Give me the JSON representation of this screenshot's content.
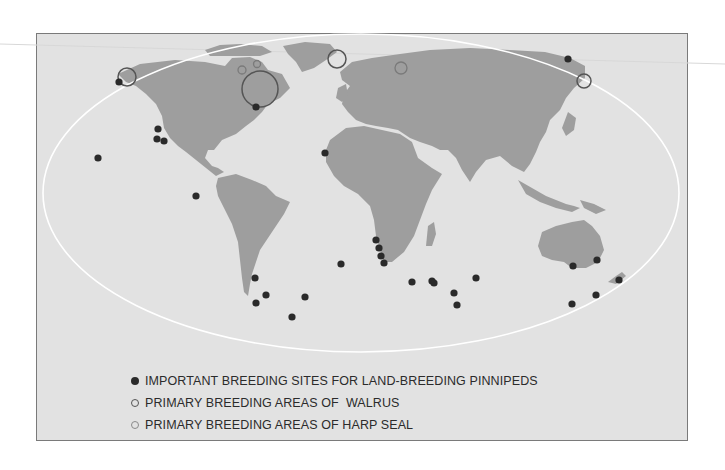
{
  "map": {
    "type": "world-map",
    "projection": "oval (Robinson-like)",
    "colors": {
      "background": "#e2e2e2",
      "land": "#9e9e9e",
      "oval_outline": "#ffffff",
      "breeding_site_marker": "#2a2a2a",
      "walrus_marker": "#555555",
      "harp_seal_marker": "#8a8a8a"
    }
  },
  "legend": {
    "items": [
      {
        "symbol": "filled-dot",
        "label": "IMPORTANT BREEDING SITES FOR LAND-BREEDING PINNIPEDS"
      },
      {
        "symbol": "open-circle-dark",
        "label": "PRIMARY BREEDING AREAS OF  WALRUS"
      },
      {
        "symbol": "open-circle-light",
        "label": "PRIMARY BREEDING AREAS OF HARP SEAL"
      }
    ]
  },
  "markers": {
    "breeding_sites": [
      {
        "x": 119,
        "y": 82
      },
      {
        "x": 98,
        "y": 158
      },
      {
        "x": 158,
        "y": 129
      },
      {
        "x": 157,
        "y": 139
      },
      {
        "x": 164,
        "y": 141
      },
      {
        "x": 196,
        "y": 196
      },
      {
        "x": 256,
        "y": 107
      },
      {
        "x": 325,
        "y": 153
      },
      {
        "x": 568,
        "y": 59
      },
      {
        "x": 255,
        "y": 278
      },
      {
        "x": 266,
        "y": 295
      },
      {
        "x": 256,
        "y": 303
      },
      {
        "x": 305,
        "y": 297
      },
      {
        "x": 292,
        "y": 317
      },
      {
        "x": 341,
        "y": 264
      },
      {
        "x": 376,
        "y": 240
      },
      {
        "x": 379,
        "y": 248
      },
      {
        "x": 381,
        "y": 256
      },
      {
        "x": 384,
        "y": 263
      },
      {
        "x": 412,
        "y": 282
      },
      {
        "x": 432,
        "y": 281
      },
      {
        "x": 434,
        "y": 283
      },
      {
        "x": 454,
        "y": 293
      },
      {
        "x": 457,
        "y": 305
      },
      {
        "x": 476,
        "y": 278
      },
      {
        "x": 573,
        "y": 266
      },
      {
        "x": 597,
        "y": 260
      },
      {
        "x": 619,
        "y": 280
      },
      {
        "x": 596,
        "y": 295
      },
      {
        "x": 572,
        "y": 304
      }
    ],
    "walrus_areas": [
      {
        "x": 127,
        "y": 77,
        "r": 9
      },
      {
        "x": 260,
        "y": 89,
        "r": 18
      },
      {
        "x": 337,
        "y": 59,
        "r": 9
      },
      {
        "x": 584,
        "y": 81,
        "r": 7
      }
    ],
    "harp_seal_areas": [
      {
        "x": 242,
        "y": 70,
        "r": 4
      },
      {
        "x": 257,
        "y": 64,
        "r": 3.5
      },
      {
        "x": 401,
        "y": 68,
        "r": 6
      }
    ]
  }
}
